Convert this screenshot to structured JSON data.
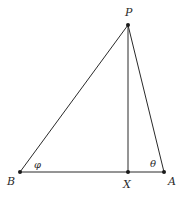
{
  "diagram": {
    "type": "triangle-with-altitude",
    "points": {
      "P": {
        "label": "P",
        "x": 128,
        "y": 25
      },
      "B": {
        "label": "B",
        "x": 20,
        "y": 172
      },
      "X": {
        "label": "X",
        "x": 128,
        "y": 172
      },
      "A": {
        "label": "A",
        "x": 164,
        "y": 172
      }
    },
    "segments": [
      {
        "from": "P",
        "to": "B"
      },
      {
        "from": "P",
        "to": "A"
      },
      {
        "from": "P",
        "to": "X"
      },
      {
        "from": "B",
        "to": "A"
      }
    ],
    "angles": {
      "at_B": {
        "label": "φ"
      },
      "at_A": {
        "label": "θ"
      }
    },
    "line_color": "#2a2a2a"
  }
}
